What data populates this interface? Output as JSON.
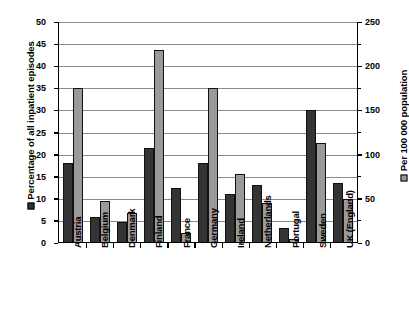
{
  "chart_data": {
    "type": "bar",
    "title": "",
    "xlabel": "",
    "grid": true,
    "legend_position": "axis-titles",
    "categories": [
      "Austria",
      "Belgium",
      "Denmark",
      "Finland",
      "France",
      "Germany",
      "Ireland",
      "Netherlands",
      "Portugal",
      "Sweden",
      "UK (England)"
    ],
    "series": [
      {
        "name": "Percentage of all inpatient episodes",
        "axis": "left",
        "color": "#343434",
        "values": [
          18.0,
          5.9,
          4.8,
          21.5,
          12.5,
          18.0,
          11.0,
          13.2,
          3.5,
          30.2,
          13.5
        ]
      },
      {
        "name": "Per 100 000 population",
        "axis": "right",
        "color": "#9a9a9a",
        "values": [
          175,
          47,
          34,
          218,
          11,
          175,
          78,
          45,
          5,
          113,
          50
        ]
      }
    ],
    "left_axis": {
      "label": "Percentage of all inpatient episodes",
      "ticks": [
        "50",
        "45",
        "40",
        "35",
        "30",
        "25",
        "20",
        "15",
        "10",
        "5",
        "0"
      ],
      "min": 0,
      "max": 50,
      "step": 5,
      "legend_marker": "dark-square"
    },
    "right_axis": {
      "label": "Per 100 000 population",
      "ticks": [
        "250",
        "200",
        "150",
        "100",
        "50",
        "0"
      ],
      "min": 0,
      "max": 250,
      "step": 50,
      "legend_marker": "gray-square"
    },
    "colors": {
      "series_dark": "#343434",
      "series_gray": "#9a9a9a",
      "gridline": "#8a8a8a",
      "axis": "#000000",
      "background": "#ffffff"
    }
  }
}
